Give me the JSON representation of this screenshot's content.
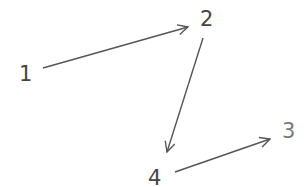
{
  "diagram": {
    "type": "directed-graph",
    "colors": {
      "line": "#555555",
      "text": "#444444",
      "background": "#ffffff"
    },
    "nodes": [
      {
        "id": "1",
        "label": "1",
        "x": 25,
        "y": 80
      },
      {
        "id": "2",
        "label": "2",
        "x": 207,
        "y": 26
      },
      {
        "id": "3",
        "label": "3",
        "x": 288,
        "y": 138
      },
      {
        "id": "4",
        "label": "4",
        "x": 155,
        "y": 185
      }
    ],
    "edges": [
      {
        "from": "1",
        "to": "2"
      },
      {
        "from": "2",
        "to": "4"
      },
      {
        "from": "4",
        "to": "3"
      }
    ]
  }
}
